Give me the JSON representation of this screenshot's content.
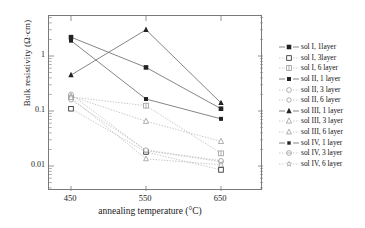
{
  "chart_data": {
    "type": "line",
    "title": "",
    "xlabel": "annealing temperature (°C)",
    "ylabel": "Bulk resistivity (Ω·cm)",
    "x": [
      450,
      550,
      650
    ],
    "xtick_labels": [
      "450",
      "550",
      "650"
    ],
    "ytick_labels": [
      "1",
      "0.1",
      "0.01"
    ],
    "ytick_values": [
      1,
      0.1,
      0.01
    ],
    "yscale": "log",
    "ylim": [
      0.005,
      5
    ],
    "xlim": [
      410,
      690
    ],
    "grid": false,
    "legend_position": "right",
    "series": [
      {
        "name": "sol I, 1layer",
        "marker": "filled-square",
        "linestyle": "solid",
        "values": [
          2.2,
          0.62,
          0.11
        ]
      },
      {
        "name": "sol I, 3layer",
        "marker": "open-square",
        "linestyle": "dotted",
        "values": [
          0.11,
          0.018,
          0.0085
        ]
      },
      {
        "name": "sol I, 6 layer",
        "marker": "crossed-square",
        "linestyle": "dotted",
        "values": [
          0.18,
          0.125,
          0.017
        ]
      },
      {
        "name": "sol II, 1 layer",
        "marker": "filled-square-small",
        "linestyle": "solid",
        "values": [
          1.9,
          0.165,
          0.072
        ]
      },
      {
        "name": "sol II, 3 layer",
        "marker": "open-circle",
        "linestyle": "dotted",
        "values": [
          0.2,
          0.019,
          0.012
        ]
      },
      {
        "name": "sol II, 6 layer",
        "marker": "open-circle-small",
        "linestyle": "dotted",
        "values": [
          0.16,
          0.0195,
          0.0125
        ]
      },
      {
        "name": "sol III, 1 layer",
        "marker": "filled-triangle",
        "linestyle": "solid",
        "values": [
          0.45,
          3.0,
          0.14
        ]
      },
      {
        "name": "sol III, 3 layer",
        "marker": "open-triangle",
        "linestyle": "dotted",
        "values": [
          0.185,
          0.065,
          0.028
        ]
      },
      {
        "name": "sol III, 6 layer",
        "marker": "open-triangle-small",
        "linestyle": "dotted",
        "values": [
          0.175,
          0.0135,
          0.0105
        ]
      },
      {
        "name": "sol IV, 1 layer",
        "marker": "filled-square-tiny",
        "linestyle": "solid",
        "values": [
          null,
          null,
          null
        ]
      },
      {
        "name": "sol IV, 3 layer",
        "marker": "crossed-circle",
        "linestyle": "dotted",
        "values": [
          null,
          null,
          null
        ]
      },
      {
        "name": "sol IV, 6 layer",
        "marker": "star",
        "linestyle": "dotted",
        "values": [
          null,
          null,
          null
        ]
      }
    ]
  },
  "axis": {
    "y_title": "Bulk resistivity (Ω·cm)",
    "x_title": "annealing temperature (°C)",
    "y_ticks": [
      "1",
      "0.1",
      "0.01"
    ],
    "x_ticks": [
      "450",
      "550",
      "650"
    ]
  },
  "legend": {
    "items": [
      {
        "label": "sol I, 1layer"
      },
      {
        "label": "sol I, 3layer"
      },
      {
        "label": "sol I, 6 layer"
      },
      {
        "label": "sol II, 1 layer"
      },
      {
        "label": "sol II, 3 layer"
      },
      {
        "label": "sol II, 6 layer"
      },
      {
        "label": "sol III, 1 layer"
      },
      {
        "label": "sol III, 3 layer"
      },
      {
        "label": "sol III, 6 layer"
      },
      {
        "label": "sol IV, 1 layer"
      },
      {
        "label": "sol IV, 3 layer"
      },
      {
        "label": "sol IV, 6 layer"
      }
    ]
  },
  "colors": {
    "ink": "#1a1a1a",
    "frame": "#7a7a7a",
    "line": "#8c8c8c",
    "marker_fill": "#222222",
    "marker_light": "#9a9a9a"
  }
}
